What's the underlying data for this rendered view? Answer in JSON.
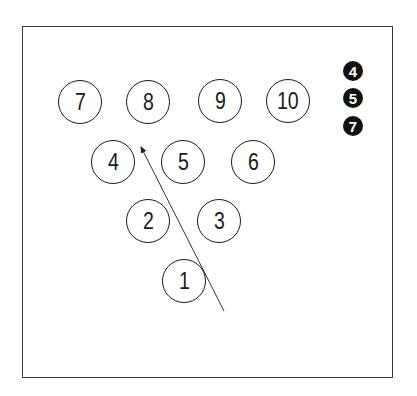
{
  "diagram": {
    "type": "bowling-pin-layout",
    "pins": [
      {
        "label": "1",
        "x": 184,
        "y": 281
      },
      {
        "label": "2",
        "x": 148,
        "y": 221
      },
      {
        "label": "3",
        "x": 219,
        "y": 221
      },
      {
        "label": "4",
        "x": 113,
        "y": 162
      },
      {
        "label": "5",
        "x": 183,
        "y": 162
      },
      {
        "label": "6",
        "x": 253,
        "y": 162
      },
      {
        "label": "7",
        "x": 80,
        "y": 102
      },
      {
        "label": "8",
        "x": 148,
        "y": 102
      },
      {
        "label": "9",
        "x": 220,
        "y": 101
      },
      {
        "label": "10",
        "x": 288,
        "y": 101
      }
    ],
    "remaining_pins_legend": [
      {
        "label": "4",
        "x": 353,
        "y": 71
      },
      {
        "label": "5",
        "x": 353,
        "y": 98
      },
      {
        "label": "7",
        "x": 353,
        "y": 126
      }
    ],
    "ball_path": {
      "from": [
        224,
        311
      ],
      "to": [
        141,
        147
      ]
    }
  }
}
